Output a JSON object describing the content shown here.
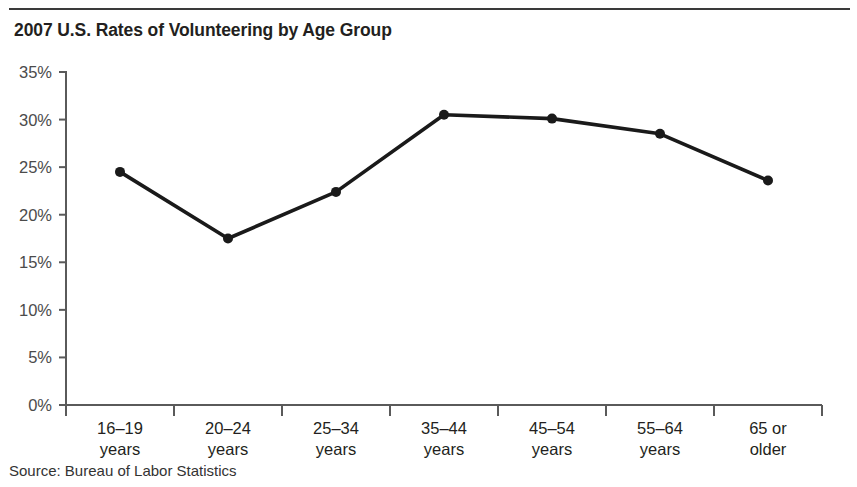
{
  "figure": {
    "title": "2007 U.S. Rates of Volunteering by Age Group",
    "source_note": "Source: Bureau of Labor Statistics"
  },
  "chart_data": {
    "type": "line",
    "title": "2007 U.S. Rates of Volunteering by Age Group",
    "xlabel": "",
    "ylabel": "",
    "categories": [
      "16–19 years",
      "20–24 years",
      "25–34 years",
      "35–44 years",
      "45–54 years",
      "55–64 years",
      "65 or older"
    ],
    "category_lines": [
      [
        "16–19",
        "years"
      ],
      [
        "20–24",
        "years"
      ],
      [
        "25–34",
        "years"
      ],
      [
        "35–44",
        "years"
      ],
      [
        "45–54",
        "years"
      ],
      [
        "55–64",
        "years"
      ],
      [
        "65 or",
        "older"
      ]
    ],
    "values": [
      24.5,
      17.5,
      22.4,
      30.5,
      30.1,
      28.5,
      23.6
    ],
    "value_unit": "%",
    "ylim": [
      0,
      35
    ],
    "ytick_values": [
      0,
      5,
      10,
      15,
      20,
      25,
      30,
      35
    ],
    "ytick_labels": [
      "0%",
      "5%",
      "10%",
      "15%",
      "20%",
      "25%",
      "30%",
      "35%"
    ],
    "grid": false,
    "legend": false,
    "legend_position": "none",
    "marker": "circle",
    "line_color": "#1a1a1a",
    "marker_color": "#1a1a1a",
    "axis_color": "#5a5a5a",
    "background_color": "#ffffff"
  }
}
